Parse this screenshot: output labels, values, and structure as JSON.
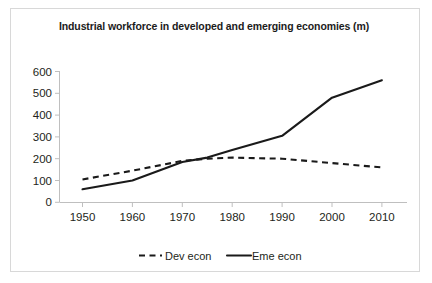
{
  "chart_data": {
    "type": "line",
    "title": "Industrial workforce in developed and emerging economies (m)",
    "xlabel": "",
    "ylabel": "",
    "x": [
      1950,
      1960,
      1970,
      1975,
      1980,
      1990,
      2000,
      2010
    ],
    "xticks": [
      "1950",
      "1960",
      "1970",
      "1980",
      "1990",
      "2000",
      "2010"
    ],
    "xtick_values": [
      1950,
      1960,
      1970,
      1980,
      1990,
      2000,
      2010
    ],
    "yticks": [
      "0",
      "100",
      "200",
      "300",
      "400",
      "500",
      "600"
    ],
    "ytick_values": [
      0,
      100,
      200,
      300,
      400,
      500,
      600
    ],
    "xlim": [
      1945,
      2015
    ],
    "ylim": [
      0,
      600
    ],
    "grid": false,
    "legend_position": "bottom",
    "series": [
      {
        "name": "Dev econ",
        "style": "dashed",
        "color": "#1a1a1a",
        "x": [
          1950,
          1960,
          1970,
          1975,
          1980,
          1990,
          2000,
          2010
        ],
        "values": [
          105,
          145,
          190,
          200,
          205,
          200,
          180,
          160
        ]
      },
      {
        "name": "Eme econ",
        "style": "solid",
        "color": "#1a1a1a",
        "x": [
          1950,
          1960,
          1970,
          1975,
          1980,
          1990,
          2000,
          2010
        ],
        "values": [
          60,
          100,
          185,
          205,
          240,
          305,
          480,
          560
        ]
      }
    ],
    "annotations": []
  },
  "legend": {
    "items": [
      {
        "label": "Dev econ",
        "style": "dashed"
      },
      {
        "label": "Eme econ",
        "style": "solid"
      }
    ]
  }
}
